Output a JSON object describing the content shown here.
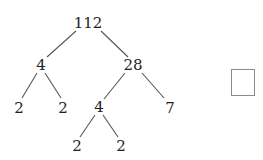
{
  "diagram": {
    "type": "factor-tree",
    "root": "112",
    "nodes": [
      {
        "id": "n112",
        "label": "112",
        "x": 88,
        "y": 23
      },
      {
        "id": "n4a",
        "label": "4",
        "x": 41,
        "y": 65
      },
      {
        "id": "n28",
        "label": "28",
        "x": 133,
        "y": 65
      },
      {
        "id": "n2a",
        "label": "2",
        "x": 19,
        "y": 108
      },
      {
        "id": "n2b",
        "label": "2",
        "x": 63,
        "y": 108
      },
      {
        "id": "n4b",
        "label": "4",
        "x": 99,
        "y": 107
      },
      {
        "id": "n7",
        "label": "7",
        "x": 170,
        "y": 108
      },
      {
        "id": "n2c",
        "label": "2",
        "x": 77,
        "y": 146
      },
      {
        "id": "n2d",
        "label": "2",
        "x": 121,
        "y": 146
      }
    ],
    "edges": [
      {
        "from": "112",
        "to": "4"
      },
      {
        "from": "112",
        "to": "28"
      },
      {
        "from": "4",
        "to": "2"
      },
      {
        "from": "4",
        "to": "2"
      },
      {
        "from": "28",
        "to": "4"
      },
      {
        "from": "28",
        "to": "7"
      },
      {
        "from": "4",
        "to": "2"
      },
      {
        "from": "4",
        "to": "2"
      }
    ],
    "answer_box": {
      "value": ""
    }
  },
  "colors": {
    "text": "#222222",
    "line": "#555555",
    "box_border": "#8a8a8a"
  }
}
